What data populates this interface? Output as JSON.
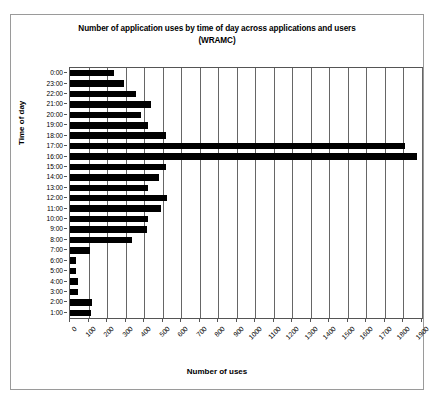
{
  "chart_data": {
    "type": "bar",
    "orientation": "horizontal",
    "title": "Number of application uses by time of day across applications and users",
    "subtitle": "(WRAMC)",
    "xlabel": "Number of uses",
    "ylabel": "Time of day",
    "xlim": [
      0,
      1900
    ],
    "xticks": [
      0,
      100,
      200,
      300,
      400,
      500,
      600,
      700,
      800,
      900,
      1000,
      1100,
      1200,
      1300,
      1400,
      1500,
      1600,
      1700,
      1800,
      1900
    ],
    "xtick_labels": [
      "0",
      "100",
      "200",
      "300",
      "400",
      "500",
      "600",
      "700",
      "800",
      "900",
      "1000",
      "1100",
      "1200",
      "1300",
      "1400",
      "1500",
      "1600",
      "1700",
      "1800",
      "1900"
    ],
    "grid": "vertical",
    "legend": null,
    "bar_color": "#000000",
    "categories": [
      "0:00",
      "23:00",
      "22:00",
      "21:00",
      "20:00",
      "19:00",
      "18:00",
      "17:00",
      "16:00",
      "15:00",
      "14:00",
      "13:00",
      "12:00",
      "11:00",
      "10:00",
      "9:00",
      "8:00",
      "7:00",
      "6:00",
      "5:00",
      "4:00",
      "3:00",
      "2:00",
      "1:00"
    ],
    "values": [
      235,
      290,
      355,
      435,
      385,
      420,
      520,
      1810,
      1875,
      520,
      480,
      420,
      525,
      490,
      420,
      415,
      335,
      110,
      30,
      35,
      45,
      45,
      120,
      115
    ]
  }
}
